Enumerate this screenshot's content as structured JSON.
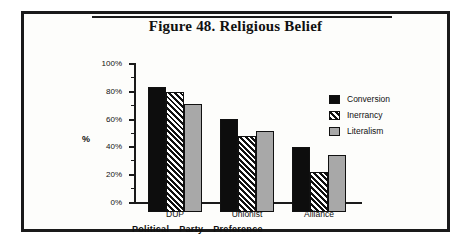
{
  "figure": {
    "title": "Figure 48. Religious Belief"
  },
  "chart_data": {
    "type": "bar",
    "title": "Figure 48. Religious Belief",
    "xlabel": "Political Party Preference",
    "xlabel_words": [
      "Political",
      "Party",
      "Preference"
    ],
    "ylabel": "%",
    "ylim": [
      0,
      100
    ],
    "ytick_labels": [
      "0%",
      "20%",
      "40%",
      "60%",
      "80%",
      "100%"
    ],
    "ytick_values": [
      0,
      20,
      40,
      60,
      80,
      100
    ],
    "yminor_values": [
      10,
      30,
      50,
      70,
      90
    ],
    "grid": false,
    "legend_position": "right",
    "categories": [
      "DUP",
      "Unionist",
      "Alliance"
    ],
    "series": [
      {
        "name": "Conversion",
        "key": "conversion",
        "color": "#0d0d0d",
        "pattern": "solid",
        "values": [
          90,
          67,
          47
        ]
      },
      {
        "name": "Inerrancy",
        "key": "inerrancy",
        "color": "#111111",
        "pattern": "diagonal-hatch",
        "values": [
          86,
          55,
          29
        ]
      },
      {
        "name": "Literalism",
        "key": "literalism",
        "color": "#a8a8a8",
        "pattern": "solid-gray",
        "values": [
          78,
          58,
          41
        ]
      }
    ]
  }
}
